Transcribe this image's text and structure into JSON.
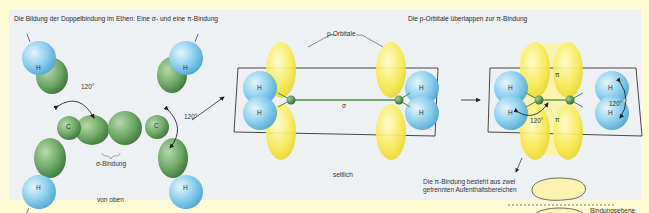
{
  "titles": {
    "left": "Die Bildung der Doppelbindung im Ethen: Eine σ- und eine π-Bindung",
    "right": "Die p-Orbitale überlappen zur π-Bindung"
  },
  "left_view": {
    "caption": "von oben",
    "atom_h": "H",
    "atom_c": "C",
    "angle_1": "120°",
    "angle_2": "120°",
    "sigma_label": "σ-Bindung"
  },
  "middle_view": {
    "caption": "seitlich",
    "orbital_label": "p-Orbitale",
    "sigma": "σ",
    "atom_h": "H"
  },
  "right_view": {
    "pi_top": "π",
    "pi_bottom": "π",
    "angle_1": "120°",
    "angle_2": "120°",
    "atom_h": "H",
    "note_line1": "Die π-Bindung besteht aus zwei",
    "note_line2": "getrennten Aufenthaltsbereichen",
    "ellipse_top": "π",
    "ellipse_bottom": "π",
    "plane_label": "Bindungsebene"
  },
  "colors": {
    "background": "#fdfcd5",
    "panel": "#eef1f4",
    "hydrogen": "#8fd0ee",
    "carbon_lobe": "#6fa868",
    "p_orbital": "#f7ec5a"
  }
}
